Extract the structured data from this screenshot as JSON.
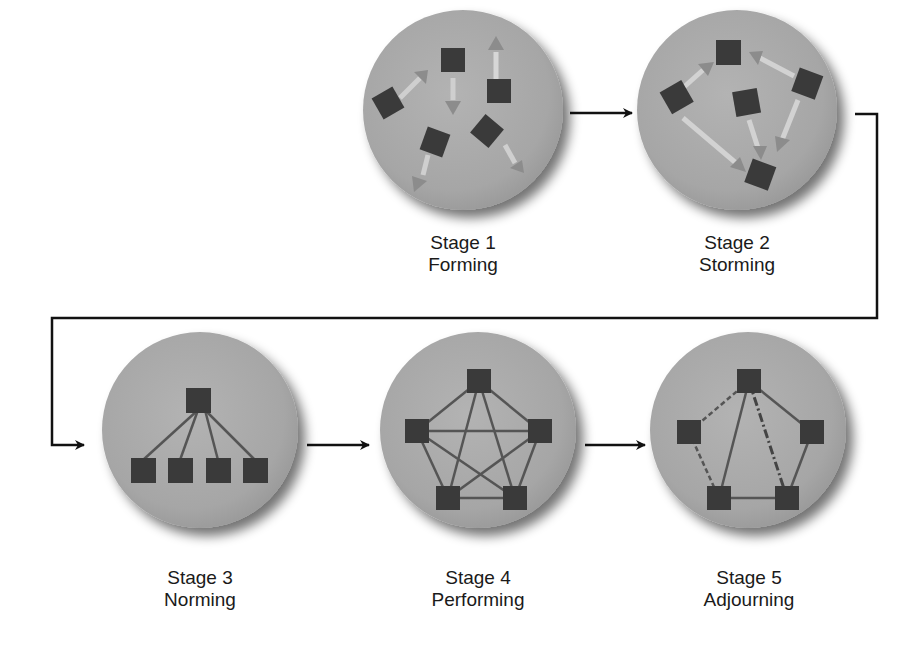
{
  "colors": {
    "circle_fill": "#a9a9a9",
    "circle_shadow": "#6e6e6e",
    "node_fill": "#3a3a3a",
    "line": "#555555",
    "arrow": "#111111",
    "background": "#ffffff"
  },
  "stages": [
    {
      "number": "Stage 1",
      "name": "Forming",
      "depiction": "members scattered, moving apart with arrows"
    },
    {
      "number": "Stage 2",
      "name": "Storming",
      "depiction": "members in conflict, arrows converging"
    },
    {
      "number": "Stage 3",
      "name": "Norming",
      "depiction": "hierarchy: one leader connected to four members"
    },
    {
      "number": "Stage 4",
      "name": "Performing",
      "depiction": "fully connected network of five members"
    },
    {
      "number": "Stage 5",
      "name": "Adjourning",
      "depiction": "network with some dashed (dissolving) links"
    }
  ],
  "flow": [
    {
      "from": "Stage 1",
      "to": "Stage 2"
    },
    {
      "from": "Stage 2",
      "to": "Stage 3"
    },
    {
      "from": "Stage 3",
      "to": "Stage 4"
    },
    {
      "from": "Stage 4",
      "to": "Stage 5"
    }
  ]
}
